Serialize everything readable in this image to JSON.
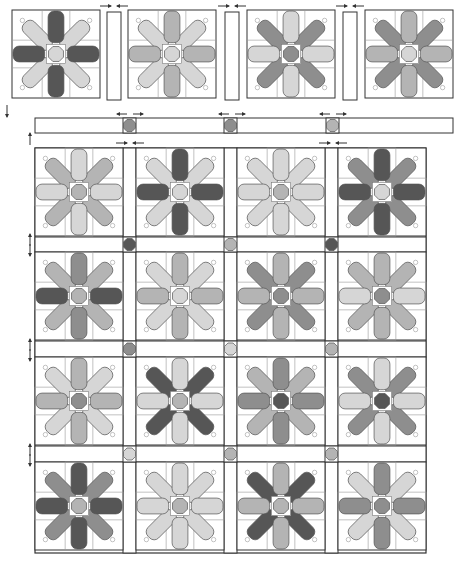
{
  "diagram": {
    "title": "Quilt assembly diagram - Eight-point star blocks with sashing",
    "colors": {
      "D": "#565656",
      "M": "#8e8e8e",
      "L": "#b4b4b4",
      "P": "#d6d6d6",
      "outline": "#555555",
      "background": "#ffffff",
      "line": "#333333"
    },
    "block_size": 88,
    "top_row": {
      "y": 10,
      "blocks": [
        {
          "x": 12,
          "diag": "P",
          "vert": "D",
          "horiz": "D",
          "center": "P"
        },
        {
          "x": 128,
          "diag": "P",
          "vert": "L",
          "horiz": "L",
          "center": "P"
        },
        {
          "x": 247,
          "diag": "M",
          "vert": "P",
          "horiz": "P",
          "center": "M"
        },
        {
          "x": 365,
          "diag": "M",
          "vert": "L",
          "horiz": "L",
          "center": "P"
        }
      ],
      "sashing": [
        {
          "x": 107,
          "y": 12,
          "w": 14,
          "h": 88
        },
        {
          "x": 225,
          "y": 12,
          "w": 14,
          "h": 88
        },
        {
          "x": 343,
          "y": 12,
          "w": 14,
          "h": 88
        }
      ],
      "press_arrows": [
        {
          "x": 114,
          "y": 6
        },
        {
          "x": 232,
          "y": 6
        },
        {
          "x": 350,
          "y": 6
        }
      ]
    },
    "sashing_row": {
      "x": 35,
      "y": 118,
      "w": 418,
      "h": 15,
      "posts": [
        {
          "x": 123,
          "color": "M"
        },
        {
          "x": 224,
          "color": "M"
        },
        {
          "x": 326,
          "color": "L"
        }
      ],
      "press_arrows": [
        {
          "x": 130,
          "y": 114,
          "dir": "out"
        },
        {
          "x": 232,
          "y": 114,
          "dir": "out"
        },
        {
          "x": 333,
          "y": 114,
          "dir": "out"
        }
      ]
    },
    "grid": {
      "x": 35,
      "y": 148,
      "w": 391,
      "h": 405,
      "cols": [
        35,
        136,
        237,
        338
      ],
      "rows": [
        148,
        252,
        357,
        462
      ],
      "sash_w": 13,
      "blocks": [
        [
          {
            "diag": "L",
            "vert": "P",
            "horiz": "P",
            "center": "L"
          },
          {
            "diag": "P",
            "vert": "D",
            "horiz": "D",
            "center": "P"
          },
          {
            "diag": "P",
            "vert": "P",
            "horiz": "P",
            "center": "L"
          },
          {
            "diag": "M",
            "vert": "D",
            "horiz": "D",
            "center": "P"
          }
        ],
        [
          {
            "diag": "L",
            "vert": "M",
            "horiz": "D",
            "center": "L"
          },
          {
            "diag": "P",
            "vert": "L",
            "horiz": "L",
            "center": "P"
          },
          {
            "diag": "M",
            "vert": "L",
            "horiz": "L",
            "center": "M"
          },
          {
            "diag": "L",
            "vert": "L",
            "horiz": "P",
            "center": "M"
          }
        ],
        [
          {
            "diag": "P",
            "vert": "L",
            "horiz": "L",
            "center": "M"
          },
          {
            "diag": "D",
            "vert": "P",
            "horiz": "P",
            "center": "L"
          },
          {
            "diag": "L",
            "vert": "M",
            "horiz": "M",
            "center": "D"
          },
          {
            "diag": "M",
            "vert": "P",
            "horiz": "P",
            "center": "D"
          }
        ],
        [
          {
            "diag": "M",
            "vert": "D",
            "horiz": "D",
            "center": "L"
          },
          {
            "diag": "P",
            "vert": "P",
            "horiz": "P",
            "center": "L"
          },
          {
            "diag": "D",
            "vert": "L",
            "horiz": "L",
            "center": "L"
          },
          {
            "diag": "P",
            "vert": "M",
            "horiz": "M",
            "center": "M"
          }
        ]
      ],
      "posts": [
        [
          "D",
          "L",
          "D"
        ],
        [
          "M",
          "P",
          "L"
        ],
        [
          "P",
          "L",
          "L"
        ]
      ],
      "press_arrows_top": [
        {
          "x": 130,
          "y": 143
        },
        {
          "x": 333,
          "y": 143
        }
      ],
      "row_arrows": [
        {
          "x": 30,
          "y": 238
        },
        {
          "x": 30,
          "y": 343
        },
        {
          "x": 30,
          "y": 448
        }
      ]
    },
    "side_arrows": [
      {
        "x": 7,
        "y": 105,
        "dir": "down"
      },
      {
        "x": 30,
        "y": 133,
        "dir": "up"
      }
    ]
  }
}
